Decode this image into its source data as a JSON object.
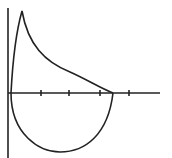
{
  "diagram": {
    "type": "flow-volume-loop",
    "stroke_color": "#222222",
    "background": "#ffffff",
    "axes": {
      "y_axis": {
        "x": 8,
        "y1": 8,
        "y2": 158
      },
      "x_axis": {
        "y": 93,
        "x1": 8,
        "x2": 160
      },
      "ticks_x": [
        41,
        69,
        100,
        129
      ],
      "tick_half_length": 3
    },
    "expiratory_curve": {
      "start": [
        11,
        93
      ],
      "peak": [
        22,
        11
      ],
      "end": [
        113,
        93
      ]
    },
    "inspiratory_curve": {
      "start": [
        11,
        93
      ],
      "bottom": [
        60,
        152
      ],
      "end": [
        113,
        93
      ]
    }
  }
}
